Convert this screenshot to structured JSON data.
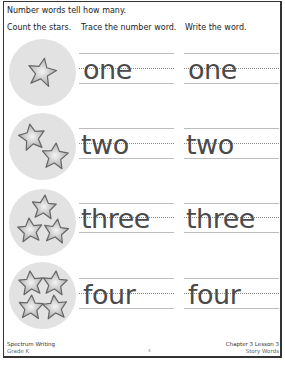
{
  "title": "Number words tell how many.",
  "headers": {
    "count": "Count the stars.",
    "trace": "Trace the number word.",
    "write": "Write the word."
  },
  "rows": [
    {
      "stars": 1,
      "trace_word": "one",
      "write_word": "one"
    },
    {
      "stars": 2,
      "trace_word": "two",
      "write_word": "two"
    },
    {
      "stars": 3,
      "trace_word": "three",
      "write_word": "three"
    },
    {
      "stars": 4,
      "trace_word": "four",
      "write_word": "four"
    }
  ],
  "footer": {
    "book": "Spectrum Writing",
    "grade": "Grade K",
    "chapter": "Chapter 3 Lesson 3",
    "lesson": "Story Words",
    "page_number": "4"
  },
  "colors": {
    "circle": "#e2e2e2",
    "star_fill": "#d4d4d4",
    "star_stroke": "#6a6a6a",
    "text": "#4a4a4a"
  }
}
